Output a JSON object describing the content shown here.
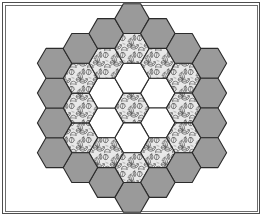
{
  "figure": {
    "background_color": "#ffffff",
    "frame": {
      "outer_border_color": "#4d4d4d",
      "inner_border_color": "#6e6e6e",
      "outer_border_width": 1,
      "inner_border_width": 1
    }
  },
  "palette": {
    "gray_fill": "#9a9a9a",
    "white_fill": "#ffffff",
    "leaf_base_fill": "#e8e8e8",
    "leaf_ink": "#3a3a3a",
    "hex_stroke": "#2b2b2b",
    "hex_stroke_width": 1.1
  },
  "geometry": {
    "center_x": 132,
    "center_y": 108,
    "hex_circumradius": 17.2,
    "orientation": "flat-top",
    "ring_count": 4
  },
  "chart_data": {
    "type": "diagram",
    "rings": [
      {
        "index": 0,
        "name": "center",
        "fill": "leaf",
        "count": 1
      },
      {
        "index": 1,
        "name": "inner-ring",
        "fill": "white",
        "count": 6
      },
      {
        "index": 2,
        "name": "middle-ring",
        "fill": "leaf",
        "count": 12
      },
      {
        "index": 3,
        "name": "outer-ring",
        "fill": "gray",
        "count": 18
      }
    ],
    "total_hexagons": 37,
    "hexagons": [
      {
        "q": 0,
        "r": 0,
        "fill": "leaf"
      },
      {
        "q": 1,
        "r": -1,
        "fill": "white"
      },
      {
        "q": 1,
        "r": 0,
        "fill": "white"
      },
      {
        "q": 0,
        "r": 1,
        "fill": "white"
      },
      {
        "q": -1,
        "r": 1,
        "fill": "white"
      },
      {
        "q": -1,
        "r": 0,
        "fill": "white"
      },
      {
        "q": 0,
        "r": -1,
        "fill": "white"
      },
      {
        "q": 2,
        "r": -2,
        "fill": "leaf"
      },
      {
        "q": 2,
        "r": -1,
        "fill": "leaf"
      },
      {
        "q": 2,
        "r": 0,
        "fill": "leaf"
      },
      {
        "q": 1,
        "r": 1,
        "fill": "leaf"
      },
      {
        "q": 0,
        "r": 2,
        "fill": "leaf"
      },
      {
        "q": -1,
        "r": 2,
        "fill": "leaf"
      },
      {
        "q": -2,
        "r": 2,
        "fill": "leaf"
      },
      {
        "q": -2,
        "r": 1,
        "fill": "leaf"
      },
      {
        "q": -2,
        "r": 0,
        "fill": "leaf"
      },
      {
        "q": -1,
        "r": -1,
        "fill": "leaf"
      },
      {
        "q": 0,
        "r": -2,
        "fill": "leaf"
      },
      {
        "q": 1,
        "r": -2,
        "fill": "leaf"
      },
      {
        "q": 3,
        "r": -3,
        "fill": "gray"
      },
      {
        "q": 3,
        "r": -2,
        "fill": "gray"
      },
      {
        "q": 3,
        "r": -1,
        "fill": "gray"
      },
      {
        "q": 3,
        "r": 0,
        "fill": "gray"
      },
      {
        "q": 2,
        "r": 1,
        "fill": "gray"
      },
      {
        "q": 1,
        "r": 2,
        "fill": "gray"
      },
      {
        "q": 0,
        "r": 3,
        "fill": "gray"
      },
      {
        "q": -1,
        "r": 3,
        "fill": "gray"
      },
      {
        "q": -2,
        "r": 3,
        "fill": "gray"
      },
      {
        "q": -3,
        "r": 3,
        "fill": "gray"
      },
      {
        "q": -3,
        "r": 2,
        "fill": "gray"
      },
      {
        "q": -3,
        "r": 1,
        "fill": "gray"
      },
      {
        "q": -3,
        "r": 0,
        "fill": "gray"
      },
      {
        "q": -2,
        "r": -1,
        "fill": "gray"
      },
      {
        "q": -1,
        "r": -2,
        "fill": "gray"
      },
      {
        "q": 0,
        "r": -3,
        "fill": "gray"
      },
      {
        "q": 1,
        "r": -3,
        "fill": "gray"
      },
      {
        "q": 2,
        "r": -3,
        "fill": "gray"
      }
    ]
  }
}
